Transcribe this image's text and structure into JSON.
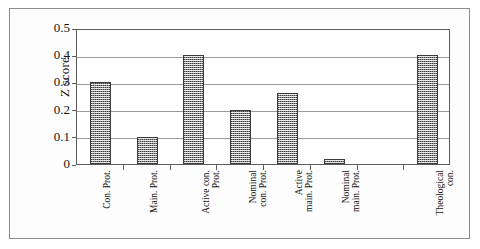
{
  "chart_data": {
    "type": "bar",
    "title": "",
    "subtitle": "",
    "xlabel": "",
    "ylabel": "Z score",
    "ylim": [
      0,
      0.5
    ],
    "yticks": [
      "0",
      "0.1",
      "0.2",
      "0.3",
      "0.4",
      "0.5"
    ],
    "ytick_values": [
      0,
      0.1,
      0.2,
      0.3,
      0.4,
      0.5
    ],
    "grid": "horizontal",
    "legend": "none",
    "categories": [
      "Con. Prot.",
      "Main. Prot.",
      "Active con. Prot.",
      "Nominal con. Prot.",
      "Active main. Prot.",
      "Nominal main. Prot.",
      "Theological con."
    ],
    "category_lines": [
      [
        "Con. Prot."
      ],
      [
        "Main. Prot."
      ],
      [
        "Active con.",
        "Prot."
      ],
      [
        "Nominal",
        "con. Prot."
      ],
      [
        "Active",
        "main. Prot."
      ],
      [
        "Nominal",
        "main. Prot."
      ],
      [
        "Theological",
        "con."
      ]
    ],
    "values": [
      0.3,
      0.1,
      0.4,
      0.2,
      0.26,
      0.02,
      0.4
    ],
    "bar_color": "#8a8a8a",
    "bar_edge_color": "#3c3c3c",
    "gridline_color": "#9a9a9a",
    "axis_color": "#5c5c5c",
    "slots": 8,
    "empty_slot_index": 6
  }
}
